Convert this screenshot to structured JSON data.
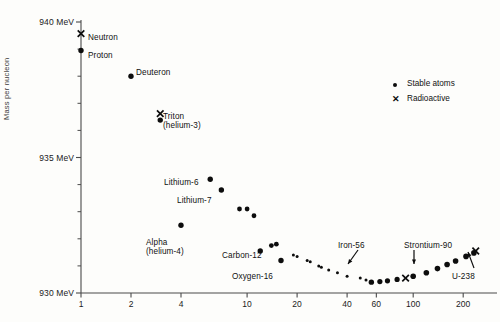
{
  "figure": {
    "background": "#fdfdfb",
    "ink": "#0d0d0d",
    "axis_color": "#4a4a4a"
  },
  "axes": {
    "ylabel": "Mass per nucleon",
    "y_tick_labels": [
      "940 MeV",
      "935 MeV",
      "930 MeV"
    ],
    "y_tick_values": [
      940,
      935,
      930
    ],
    "y_minor_count": 10,
    "x_tick_labels": [
      "1",
      "2",
      "4",
      "10",
      "20",
      "40",
      "60",
      "100",
      "200"
    ],
    "x_tick_values": [
      1,
      2,
      4,
      10,
      20,
      40,
      60,
      100,
      200
    ],
    "x_scale": "log",
    "y_range": [
      930,
      940.6
    ],
    "x_range_px": [
      81,
      481
    ]
  },
  "legend": {
    "position": "top-right",
    "entries": [
      {
        "marker": "dot",
        "label": "Stable atoms"
      },
      {
        "marker": "x",
        "label": "Radioactive"
      }
    ]
  },
  "annotations": [
    {
      "name": "neutron",
      "text": "Neutron",
      "x": 88,
      "y": 33,
      "align": "left"
    },
    {
      "name": "proton",
      "text": "Proton",
      "x": 88,
      "y": 51,
      "align": "left"
    },
    {
      "name": "deuteron",
      "text": "Deuteron",
      "x": 136,
      "y": 68,
      "align": "left"
    },
    {
      "name": "triton",
      "text": "Triton",
      "x": 163,
      "y": 112,
      "align": "left"
    },
    {
      "name": "helium-3",
      "text": "(helium-3)",
      "x": 163,
      "y": 121,
      "align": "left"
    },
    {
      "name": "lithium-6",
      "text": "Lithium-6",
      "x": 164,
      "y": 178,
      "align": "left"
    },
    {
      "name": "lithium-7",
      "text": "Lithium-7",
      "x": 177,
      "y": 196,
      "align": "left"
    },
    {
      "name": "alpha",
      "text": "Alpha",
      "x": 146,
      "y": 238,
      "align": "left"
    },
    {
      "name": "helium-4",
      "text": "(helium-4)",
      "x": 146,
      "y": 247,
      "align": "left"
    },
    {
      "name": "carbon-12",
      "text": "Carbon-12",
      "x": 222,
      "y": 251,
      "align": "left"
    },
    {
      "name": "oxygen-16",
      "text": "Oxygen-16",
      "x": 232,
      "y": 272,
      "align": "left"
    },
    {
      "name": "iron-56",
      "text": "Iron-56",
      "x": 338,
      "y": 241,
      "align": "left"
    },
    {
      "name": "strontium-90",
      "text": "Strontium-90",
      "x": 404,
      "y": 241,
      "align": "left"
    },
    {
      "name": "u-238",
      "text": "U-238",
      "x": 452,
      "y": 272,
      "align": "left"
    }
  ],
  "leader_lines": [
    {
      "name": "iron-56-arrow",
      "x1": 358,
      "y1": 250,
      "x2": 348,
      "y2": 264
    },
    {
      "name": "strontium-90-arrow",
      "x1": 414,
      "y1": 250,
      "x2": 414,
      "y2": 264
    },
    {
      "name": "u-238-arrow",
      "x1": 474,
      "y1": 268,
      "x2": 468,
      "y2": 252
    }
  ],
  "chart_data": {
    "type": "scatter",
    "title": "",
    "xlabel": "",
    "ylabel": "Mass per nucleon",
    "xscale": "log",
    "xlim": [
      0.85,
      260
    ],
    "ylim": [
      930,
      940.6
    ],
    "grid": false,
    "legend_position": "top-right",
    "series": [
      {
        "name": "Radioactive",
        "marker": "x",
        "points": [
          {
            "label": "Neutron",
            "A": 1,
            "mass": 939.57
          },
          {
            "label": "Triton",
            "A": 3,
            "mass": 936.62
          },
          {
            "label": "Strontium-90",
            "A": 90,
            "mass": 930.55
          },
          {
            "label": "U-238",
            "A": 238,
            "mass": 931.55
          }
        ]
      },
      {
        "name": "Stable atoms",
        "marker": "dot",
        "points": [
          {
            "label": "Proton",
            "A": 1,
            "mass": 938.95
          },
          {
            "label": "Deuteron",
            "A": 2,
            "mass": 938.0
          },
          {
            "label": "helium-3",
            "A": 3,
            "mass": 936.38
          },
          {
            "label": "Alpha",
            "A": 4,
            "mass": 932.5
          },
          {
            "label": "Lithium-6",
            "A": 6,
            "mass": 934.2
          },
          {
            "label": "Lithium-7",
            "A": 7,
            "mass": 933.8
          },
          {
            "label": "",
            "A": 9,
            "mass": 933.1
          },
          {
            "label": "",
            "A": 10,
            "mass": 933.1
          },
          {
            "label": "",
            "A": 11,
            "mass": 932.85
          },
          {
            "label": "Carbon-12",
            "A": 12,
            "mass": 931.55
          },
          {
            "label": "",
            "A": 14,
            "mass": 931.75
          },
          {
            "label": "",
            "A": 15,
            "mass": 931.8
          },
          {
            "label": "Oxygen-16",
            "A": 16,
            "mass": 931.2
          },
          {
            "label": "",
            "A": 19,
            "mass": 931.4
          },
          {
            "label": "",
            "A": 20,
            "mass": 931.35
          },
          {
            "label": "",
            "A": 23,
            "mass": 931.2
          },
          {
            "label": "",
            "A": 24,
            "mass": 931.15
          },
          {
            "label": "",
            "A": 27,
            "mass": 931.0
          },
          {
            "label": "",
            "A": 28,
            "mass": 930.95
          },
          {
            "label": "",
            "A": 31,
            "mass": 930.85
          },
          {
            "label": "",
            "A": 35,
            "mass": 930.75
          },
          {
            "label": "",
            "A": 40,
            "mass": 930.62
          },
          {
            "label": "Iron-56",
            "A": 56,
            "mass": 930.4
          },
          {
            "label": "",
            "A": 48,
            "mass": 930.55
          },
          {
            "label": "",
            "A": 52,
            "mass": 930.48
          },
          {
            "label": "",
            "A": 63,
            "mass": 930.42
          },
          {
            "label": "",
            "A": 70,
            "mass": 930.45
          },
          {
            "label": "",
            "A": 80,
            "mass": 930.5
          },
          {
            "label": "",
            "A": 100,
            "mass": 930.62
          },
          {
            "label": "",
            "A": 120,
            "mass": 930.75
          },
          {
            "label": "",
            "A": 140,
            "mass": 930.9
          },
          {
            "label": "",
            "A": 160,
            "mass": 931.05
          },
          {
            "label": "",
            "A": 180,
            "mass": 931.18
          },
          {
            "label": "",
            "A": 208,
            "mass": 931.35
          },
          {
            "label": "",
            "A": 232,
            "mass": 931.48
          }
        ]
      }
    ]
  }
}
